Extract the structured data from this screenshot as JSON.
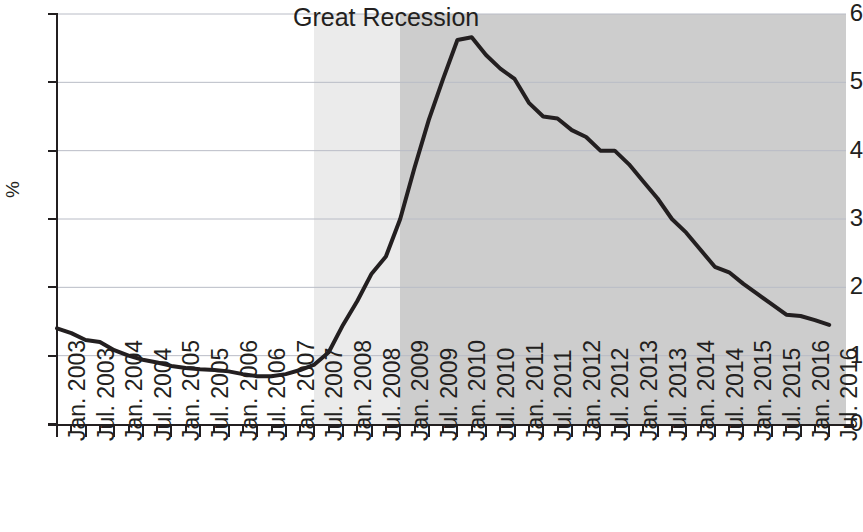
{
  "chart_data": {
    "type": "line",
    "title": "",
    "xlabel": "",
    "ylabel": "%",
    "ylim": [
      0,
      6
    ],
    "yticks": [
      0,
      1,
      2,
      3,
      4,
      5,
      6
    ],
    "ytick_labels": [
      "0",
      "1",
      "2",
      "3",
      "4",
      "5",
      "6"
    ],
    "grid": "horizontal",
    "legend": "none",
    "line_color": "#231f20",
    "line_width": 4,
    "annotations": [
      {
        "text": "Great Recession",
        "x": "Jan. 2008",
        "y": 5.95,
        "name": "great-recession-label"
      }
    ],
    "shaded_regions": [
      {
        "name": "recession-onset-band",
        "from": "Jul. 2007",
        "to": "Jan. 2009",
        "color": "#ebebeb"
      },
      {
        "name": "recession-aftermath-band",
        "from": "Jan. 2009",
        "to": "Jul. 2016",
        "color": "#cdcdcd"
      }
    ],
    "xtick_labels": [
      "Jan. 2003",
      "Jul. 2003",
      "Jan. 2004",
      "Jul. 2004",
      "Jan. 2005",
      "Jul. 2005",
      "Jan. 2006",
      "Jul. 2006",
      "Jan. 2007",
      "Jul. 2007",
      "Jan. 2008",
      "Jul. 2008",
      "Jan. 2009",
      "Jul. 2009",
      "Jan. 2010",
      "Jul. 2010",
      "Jan. 2011",
      "Jul. 2011",
      "Jan. 2012",
      "Jul. 2012",
      "Jan. 2013",
      "Jul. 2013",
      "Jan. 2014",
      "Jul. 2014",
      "Jan. 2015",
      "Jul. 2015",
      "Jan. 2016",
      "Jul. 2016"
    ],
    "x": [
      "Jan. 2003",
      "Apr. 2003",
      "Jul. 2003",
      "Oct. 2003",
      "Jan. 2004",
      "Apr. 2004",
      "Jul. 2004",
      "Oct. 2004",
      "Jan. 2005",
      "Apr. 2005",
      "Jul. 2005",
      "Oct. 2005",
      "Jan. 2006",
      "Apr. 2006",
      "Jul. 2006",
      "Oct. 2006",
      "Jan. 2007",
      "Apr. 2007",
      "Jul. 2007",
      "Oct. 2007",
      "Jan. 2008",
      "Apr. 2008",
      "Jul. 2008",
      "Oct. 2008",
      "Jan. 2009",
      "Apr. 2009",
      "Jul. 2009",
      "Oct. 2009",
      "Jan. 2010",
      "Apr. 2010",
      "Jul. 2010",
      "Oct. 2010",
      "Jan. 2011",
      "Apr. 2011",
      "Jul. 2011",
      "Oct. 2011",
      "Jan. 2012",
      "Apr. 2012",
      "Jul. 2012",
      "Oct. 2012",
      "Jan. 2013",
      "Apr. 2013",
      "Jul. 2013",
      "Oct. 2013",
      "Jan. 2014",
      "Apr. 2014",
      "Jul. 2014",
      "Oct. 2014",
      "Jan. 2015",
      "Apr. 2015",
      "Jul. 2015",
      "Oct. 2015",
      "Jan. 2016",
      "Apr. 2016",
      "Jul. 2016"
    ],
    "values": [
      1.4,
      1.33,
      1.23,
      1.2,
      1.08,
      1.0,
      0.94,
      0.9,
      0.85,
      0.82,
      0.8,
      0.79,
      0.77,
      0.73,
      0.7,
      0.7,
      0.73,
      0.79,
      0.87,
      1.05,
      1.45,
      1.8,
      2.2,
      2.45,
      3.0,
      3.75,
      4.45,
      5.05,
      5.62,
      5.66,
      5.4,
      5.2,
      5.05,
      4.7,
      4.5,
      4.47,
      4.3,
      4.2,
      4.0,
      4.0,
      3.8,
      3.55,
      3.3,
      3.0,
      2.8,
      2.55,
      2.3,
      2.22,
      2.05,
      1.9,
      1.75,
      1.6,
      1.58,
      1.52,
      1.45
    ]
  },
  "axis": {
    "y_title": "%"
  }
}
